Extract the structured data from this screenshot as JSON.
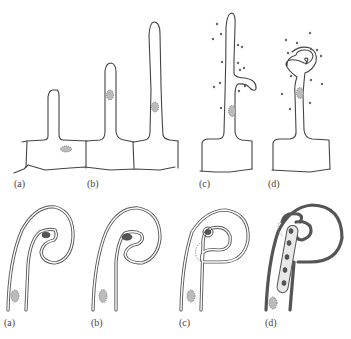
{
  "figure": {
    "top_row": {
      "panels": [
        {
          "id": "a",
          "label": "(a)",
          "stage": "short root hair emerging from epidermal cell"
        },
        {
          "id": "b",
          "label": "(b)",
          "stage": "elongating root hair with nucleus"
        },
        {
          "id": "c",
          "label": "(c)",
          "stage": "root hair deforming with bacteria present"
        },
        {
          "id": "d",
          "label": "(d)",
          "stage": "root hair curling around bacteria"
        }
      ]
    },
    "bottom_row": {
      "panels": [
        {
          "id": "a",
          "label": "(a)",
          "stage": "bacteria trapped in curled root hair tip"
        },
        {
          "id": "b",
          "label": "(b)",
          "stage": "bacterial colony in curl"
        },
        {
          "id": "c",
          "label": "(c)",
          "stage": "infection thread initiation"
        },
        {
          "id": "d",
          "label": "(d)",
          "stage": "infection thread growing with bacteria"
        }
      ]
    },
    "colors": {
      "line": "#444444",
      "nucleus": "#bbbbbb",
      "background": "#ffffff"
    }
  }
}
